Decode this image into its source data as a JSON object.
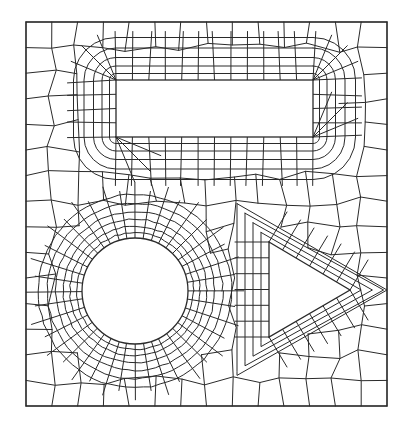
{
  "diagram": {
    "type": "quadrilateral-finite-element-mesh",
    "colors": {
      "line": "#2a2a2a",
      "background": "#ffffff"
    },
    "outer_boundary": {
      "x": 26,
      "y": 22,
      "width": 361,
      "height": 384
    },
    "holes": [
      {
        "shape": "rectangle",
        "x": 116,
        "y": 80,
        "width": 197,
        "height": 57
      },
      {
        "shape": "circle",
        "cx": 135,
        "cy": 291,
        "r": 53
      },
      {
        "shape": "triangle",
        "points": [
          [
            269,
            242
          ],
          [
            350,
            290
          ],
          [
            269,
            337
          ]
        ]
      }
    ],
    "mesh": {
      "rect_rings": 5,
      "circle_rings": 6,
      "circle_spokes": 40,
      "triangle_rings": 4,
      "grid_cols": 14,
      "grid_rows": 15
    }
  }
}
